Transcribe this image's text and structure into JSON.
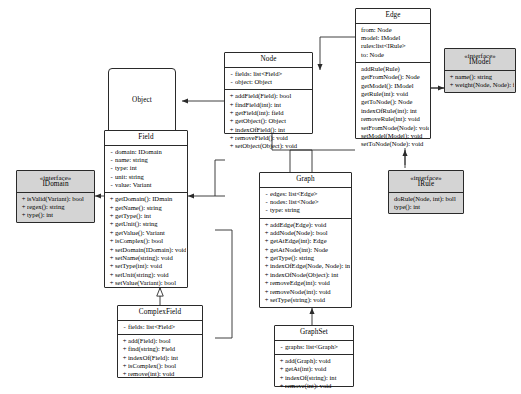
{
  "diagram": {
    "type": "uml-class-diagram",
    "background_color": "#ffffff",
    "line_color": "#2a2a2a",
    "interface_fill": "#d4d4d4",
    "class_fill": "#ffffff"
  },
  "classes": {
    "object": {
      "name": "Object",
      "stereotype": "",
      "attributes": [],
      "methods": []
    },
    "node": {
      "name": "Node",
      "stereotype": "",
      "attributes": [
        {
          "vis": "-",
          "sig": "fields: list<Field>"
        },
        {
          "vis": "-",
          "sig": "object: Object"
        }
      ],
      "methods": [
        {
          "vis": "+",
          "sig": "addField(Field): bool"
        },
        {
          "vis": "+",
          "sig": "findField(int): int"
        },
        {
          "vis": "+",
          "sig": "getField(int): field"
        },
        {
          "vis": "+",
          "sig": "getObject(): Object"
        },
        {
          "vis": "+",
          "sig": "indexOfField(): int"
        },
        {
          "vis": "+",
          "sig": "removeField(): void"
        },
        {
          "vis": "+",
          "sig": "setObject(Object): void"
        }
      ]
    },
    "edge": {
      "name": "Edge",
      "stereotype": "",
      "attributes": [
        {
          "vis": "",
          "sig": "from: Node"
        },
        {
          "vis": "",
          "sig": "model: IModel"
        },
        {
          "vis": "",
          "sig": "rules:list<IRule>"
        },
        {
          "vis": "",
          "sig": "to: Node"
        }
      ],
      "methods": [
        {
          "vis": "",
          "sig": "addRule(Rule)"
        },
        {
          "vis": "",
          "sig": "getFromNode(): Node"
        },
        {
          "vis": "",
          "sig": "getModel(): IModel"
        },
        {
          "vis": "",
          "sig": "getRule(int): void"
        },
        {
          "vis": "",
          "sig": "getToNode(): Node"
        },
        {
          "vis": "",
          "sig": "indexOfRule(int): int"
        },
        {
          "vis": "",
          "sig": "removeRule(int): void"
        },
        {
          "vis": "",
          "sig": "setFromNode(Node): void"
        },
        {
          "vis": "",
          "sig": "setModel(Model): void"
        },
        {
          "vis": "",
          "sig": "setToNode(Node): void"
        }
      ]
    },
    "imodel": {
      "name": "IModel",
      "stereotype": "«interface»",
      "attributes": [],
      "methods": [
        {
          "vis": "+",
          "sig": "name(): string"
        },
        {
          "vis": "+",
          "sig": "weight(Node, Node): float"
        }
      ]
    },
    "field": {
      "name": "Field",
      "stereotype": "",
      "attributes": [
        {
          "vis": "-",
          "sig": "domain: IDomain"
        },
        {
          "vis": "-",
          "sig": "name: string"
        },
        {
          "vis": "-",
          "sig": "type: int"
        },
        {
          "vis": "-",
          "sig": "unit: string"
        },
        {
          "vis": "-",
          "sig": "value: Variant"
        }
      ],
      "methods": [
        {
          "vis": "+",
          "sig": "getDomain(): IDmain"
        },
        {
          "vis": "+",
          "sig": "getName(): string"
        },
        {
          "vis": "+",
          "sig": "getType(): int"
        },
        {
          "vis": "+",
          "sig": "getUnit(): string"
        },
        {
          "vis": "+",
          "sig": "getValue(): Variant"
        },
        {
          "vis": "+",
          "sig": "isComplex(): bool"
        },
        {
          "vis": "+",
          "sig": "setDomain(IDomain): void"
        },
        {
          "vis": "+",
          "sig": "setName(string): void"
        },
        {
          "vis": "+",
          "sig": "setType(int): void"
        },
        {
          "vis": "+",
          "sig": "setUnit(string): void"
        },
        {
          "vis": "+",
          "sig": "setValue(Variant): bool"
        }
      ]
    },
    "idomain": {
      "name": "IDomain",
      "stereotype": "«interface»",
      "attributes": [],
      "methods": [
        {
          "vis": "+",
          "sig": "isValid(Variant): bool"
        },
        {
          "vis": "+",
          "sig": "regex(): string"
        },
        {
          "vis": "+",
          "sig": "type(): int"
        }
      ]
    },
    "graph": {
      "name": "Graph",
      "stereotype": "",
      "attributes": [
        {
          "vis": "-",
          "sig": "edges: list<Edge>"
        },
        {
          "vis": "-",
          "sig": "nodes: list<Node>"
        },
        {
          "vis": "-",
          "sig": "type: string"
        }
      ],
      "methods": [
        {
          "vis": "+",
          "sig": "addEdge(Edge): void"
        },
        {
          "vis": "+",
          "sig": "addNode(Node): bool"
        },
        {
          "vis": "+",
          "sig": "getAtEdge(int): Edge"
        },
        {
          "vis": "+",
          "sig": "getAtNode(int): Node"
        },
        {
          "vis": "+",
          "sig": "getType(): string"
        },
        {
          "vis": "+",
          "sig": "indexOfEdge(Node, Node): int"
        },
        {
          "vis": "+",
          "sig": "indexOfNode(Object): int"
        },
        {
          "vis": "+",
          "sig": "removeEdge(int): void"
        },
        {
          "vis": "+",
          "sig": "removeNode(int): void"
        },
        {
          "vis": "+",
          "sig": "setType(string): void"
        }
      ]
    },
    "irule": {
      "name": "IRule",
      "stereotype": "«interface»",
      "attributes": [],
      "methods": [
        {
          "vis": "",
          "sig": "doRule(Node, int): boll"
        },
        {
          "vis": "",
          "sig": "type(): int"
        }
      ]
    },
    "complexfield": {
      "name": "ComplexField",
      "stereotype": "",
      "attributes": [
        {
          "vis": "-",
          "sig": "fields: list<Field>"
        }
      ],
      "methods": [
        {
          "vis": "+",
          "sig": "add(Field): bool"
        },
        {
          "vis": "+",
          "sig": "find(string): Field"
        },
        {
          "vis": "+",
          "sig": "indexOf(Field): int"
        },
        {
          "vis": "+",
          "sig": "isComplex(): bool"
        },
        {
          "vis": "+",
          "sig": "remove(int): void"
        }
      ]
    },
    "graphset": {
      "name": "GraphSet",
      "stereotype": "",
      "attributes": [
        {
          "vis": "-",
          "sig": "graphs: list<Graph>"
        }
      ],
      "methods": [
        {
          "vis": "+",
          "sig": "add(Graph): void"
        },
        {
          "vis": "+",
          "sig": "getAt(int): void"
        },
        {
          "vis": "+",
          "sig": "indexOf(string): int"
        },
        {
          "vis": "+",
          "sig": "remove(int): void"
        }
      ]
    }
  }
}
